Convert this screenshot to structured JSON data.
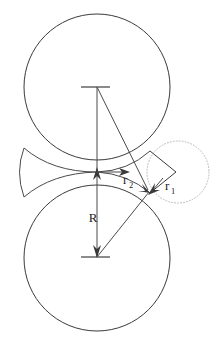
{
  "figure": {
    "background_color": "#ffffff",
    "line_color": "#3a3a3a",
    "dotted_circle_color": "#b9b9b9",
    "labels": {
      "big_radius": "R",
      "small_radius_1_base": "r",
      "small_radius_1_sub": "1",
      "small_radius_2_base": "r",
      "small_radius_2_sub": "2"
    },
    "shapes": {
      "upper_circle": {
        "name": "upper-large-circle",
        "cx": 97,
        "cy": 87,
        "r": 73
      },
      "lower_circle": {
        "name": "lower-large-circle",
        "cx": 97,
        "cy": 258,
        "r": 73
      },
      "dotted_circle": {
        "name": "dotted-small-circle",
        "cx": 178,
        "cy": 172,
        "r": 31
      },
      "tangency_point": {
        "x": 97,
        "y": 172
      },
      "rhombus_right_vertex": {
        "x": 176,
        "y": 172
      },
      "rhombus_top_vertex": {
        "x": 150,
        "y": 151
      },
      "rhombus_bottom_vertex": {
        "x": 150,
        "y": 193
      },
      "r2_arrow_tip": {
        "x": 128,
        "y": 172
      }
    },
    "measurements": {
      "R_arrow_from": {
        "x": 97,
        "y": 172
      },
      "R_arrow_to": {
        "x": 97,
        "y": 257
      },
      "top_tick_y": 87,
      "bottom_tick_y": 257
    }
  }
}
